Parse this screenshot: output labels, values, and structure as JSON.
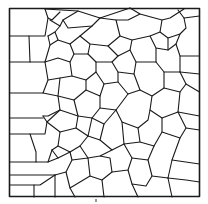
{
  "diagram": {
    "type": "polygonal cell tessellation (grain/foam structure)",
    "frame": {
      "x": 9,
      "y": 8,
      "width": 191,
      "height": 189
    },
    "stroke_color": "#1a1a1a",
    "background_color": "#ffffff",
    "caption": "ı"
  }
}
